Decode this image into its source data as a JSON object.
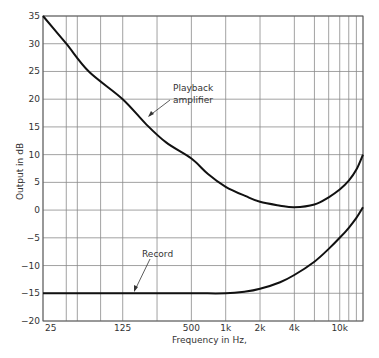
{
  "chart_data": {
    "type": "line",
    "title": "",
    "xlabel": "Frequency in Hz,",
    "ylabel": "Output in dB",
    "xscale": "log",
    "xlim": [
      25,
      16000
    ],
    "ylim": [
      -20,
      35
    ],
    "grid": true,
    "legend": "none (curves labelled with annotations)",
    "x_tick_labels": [
      "25",
      "125",
      "500",
      "1k",
      "2k",
      "4k",
      "10k"
    ],
    "x_tick_values": [
      25,
      125,
      500,
      1000,
      2000,
      4000,
      10000
    ],
    "x_gridlines_hz": [
      25,
      40,
      50,
      80,
      125,
      250,
      500,
      1000,
      2000,
      4000,
      6000,
      8000,
      10000,
      12000,
      14000,
      16000
    ],
    "y_ticks": [
      35,
      30,
      25,
      20,
      15,
      10,
      5,
      0,
      -5,
      -10,
      -15,
      -20
    ],
    "series": [
      {
        "name": "Playback amplifier",
        "x": [
          25,
          40,
          63,
          125,
          200,
          300,
          500,
          700,
          1000,
          1500,
          2000,
          3000,
          4000,
          6000,
          8000,
          10000,
          12000,
          14000,
          16000
        ],
        "values": [
          35,
          30,
          25,
          20,
          15.5,
          12.2,
          9.3,
          6.5,
          4.2,
          2.5,
          1.5,
          0.8,
          0.5,
          1.0,
          2.3,
          3.7,
          5.3,
          7.3,
          10.0
        ]
      },
      {
        "name": "Record",
        "x": [
          25,
          125,
          500,
          1000,
          1500,
          2000,
          3000,
          4000,
          6000,
          8000,
          10000,
          12000,
          14000,
          16000
        ],
        "values": [
          -15,
          -15,
          -15,
          -15,
          -14.7,
          -14.2,
          -13,
          -11.7,
          -9.3,
          -7.0,
          -5.0,
          -3.2,
          -1.4,
          0.5
        ]
      }
    ],
    "annotations": [
      {
        "text": [
          "Playback",
          "amplifier"
        ],
        "target_series": "Playback amplifier"
      },
      {
        "text": [
          "Record"
        ],
        "target_series": "Record"
      }
    ]
  },
  "axes": {
    "y_label": "Output in dB",
    "x_label": "Frequency in Hz,"
  },
  "annotations": {
    "playback_line1": "Playback",
    "playback_line2": "amplifier",
    "record": "Record"
  },
  "colors": {
    "curve": "#111111",
    "grid": "#8a8a8a",
    "text": "#333333"
  }
}
